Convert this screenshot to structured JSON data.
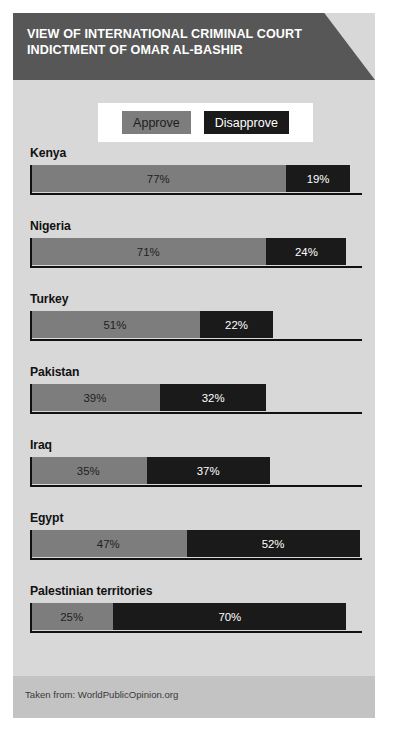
{
  "header": {
    "title_line1": "VIEW OF INTERNATIONAL CRIMINAL COURT",
    "title_line2": "INDICTMENT OF OMAR AL-BASHIR"
  },
  "legend": {
    "approve_label": "Approve",
    "disapprove_label": "Disapprove"
  },
  "footer": {
    "source": "Taken from: WorldPublicOpinion.org"
  },
  "colors": {
    "approve": "#7d7d7d",
    "disapprove": "#1a1a1a",
    "header_band": "#575757",
    "card_background": "#d8d8d8",
    "footer_band": "#c3c3c3"
  },
  "chart_data": {
    "type": "bar",
    "title": "VIEW OF INTERNATIONAL CRIMINAL COURT INDICTMENT OF OMAR AL-BASHIR",
    "subtitle": "",
    "orientation": "horizontal",
    "stacked": true,
    "xlabel": "",
    "ylabel": "",
    "xlim": [
      0,
      100
    ],
    "grid": false,
    "legend_position": "top",
    "source": "Taken from: WorldPublicOpinion.org",
    "categories": [
      "Kenya",
      "Nigeria",
      "Turkey",
      "Pakistan",
      "Iraq",
      "Egypt",
      "Palestinian territories"
    ],
    "series": [
      {
        "name": "Approve",
        "color": "#7d7d7d",
        "values": [
          77,
          71,
          51,
          39,
          35,
          47,
          25
        ],
        "labels": [
          "77%",
          "71%",
          "51%",
          "39%",
          "35%",
          "47%",
          "25%"
        ]
      },
      {
        "name": "Disapprove",
        "color": "#1a1a1a",
        "values": [
          19,
          24,
          22,
          32,
          37,
          52,
          70
        ],
        "labels": [
          "19%",
          "24%",
          "22%",
          "32%",
          "37%",
          "52%",
          "70%"
        ]
      }
    ],
    "rows": [
      {
        "country": "Kenya",
        "approve": 77,
        "disapprove": 19,
        "approve_label": "77%",
        "disapprove_label": "19%"
      },
      {
        "country": "Nigeria",
        "approve": 71,
        "disapprove": 24,
        "approve_label": "71%",
        "disapprove_label": "24%"
      },
      {
        "country": "Turkey",
        "approve": 51,
        "disapprove": 22,
        "approve_label": "51%",
        "disapprove_label": "22%"
      },
      {
        "country": "Pakistan",
        "approve": 39,
        "disapprove": 32,
        "approve_label": "39%",
        "disapprove_label": "32%"
      },
      {
        "country": "Iraq",
        "approve": 35,
        "disapprove": 37,
        "approve_label": "35%",
        "disapprove_label": "37%"
      },
      {
        "country": "Egypt",
        "approve": 47,
        "disapprove": 52,
        "approve_label": "47%",
        "disapprove_label": "52%"
      },
      {
        "country": "Palestinian territories",
        "approve": 25,
        "disapprove": 70,
        "approve_label": "25%",
        "disapprove_label": "70%"
      }
    ]
  }
}
